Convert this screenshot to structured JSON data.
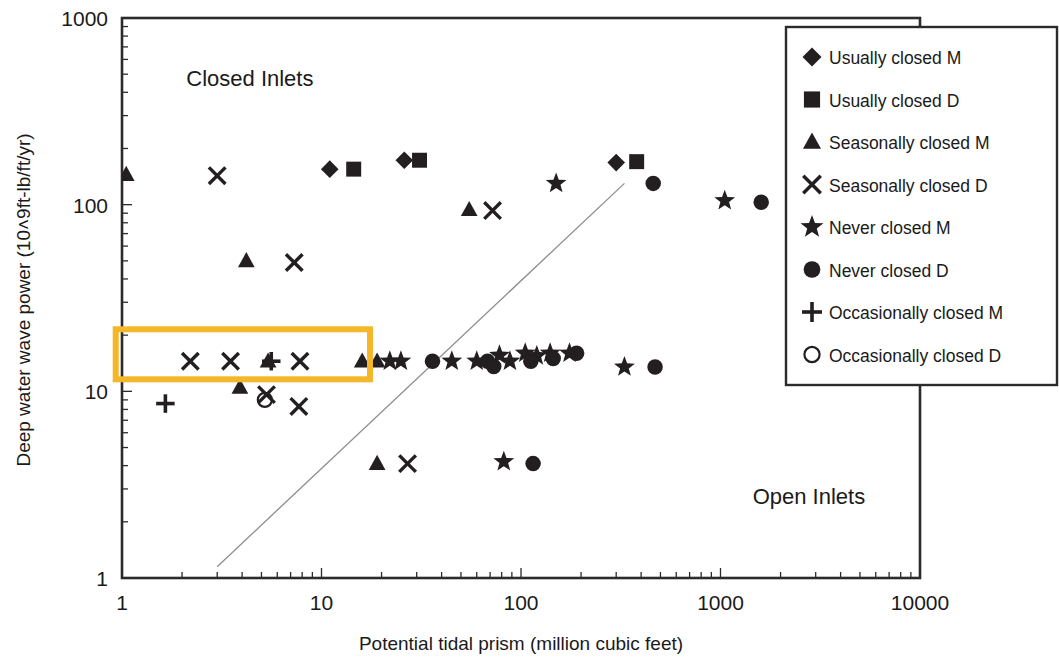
{
  "chart_data": {
    "type": "scatter",
    "title": "",
    "xlabel": "Potential tidal prism (million cubic feet)",
    "ylabel": "Deep water wave power (10^9ft-lb/ft/yr)",
    "ylabel_display": "Deep water wave power (10˄9ft-lb/ft/yr)",
    "xscale": "log",
    "yscale": "log",
    "xlim": [
      1,
      10000
    ],
    "ylim": [
      1,
      1000
    ],
    "xticks": [
      1,
      10,
      100,
      1000,
      10000
    ],
    "xtick_labels": [
      "1",
      "10",
      "100",
      "1000",
      "10000"
    ],
    "yticks": [
      1,
      10,
      100,
      1000
    ],
    "ytick_labels": [
      "1",
      "10",
      "100",
      "1000"
    ],
    "grid": false,
    "legend_position": "top-right",
    "annotations": [
      {
        "text": "Closed Inlets",
        "x": 2.1,
        "y": 430
      },
      {
        "text": "Open Inlets",
        "x": 1450,
        "y": 2.5
      }
    ],
    "trend_line": {
      "x": [
        3.0,
        330
      ],
      "y": [
        1.15,
        130
      ],
      "style": "thin-gray-solid"
    },
    "series": [
      {
        "name": "Usually closed M",
        "marker": "diamond",
        "points": [
          [
            11.0,
            155
          ],
          [
            26.0,
            173
          ],
          [
            300.0,
            168
          ]
        ]
      },
      {
        "name": "Usually closed D",
        "marker": "square",
        "points": [
          [
            14.5,
            155
          ],
          [
            31.0,
            173
          ],
          [
            380.0,
            170
          ]
        ]
      },
      {
        "name": "Seasonally closed M",
        "marker": "triangle",
        "points": [
          [
            1.05,
            145
          ],
          [
            4.2,
            50
          ],
          [
            55.0,
            94
          ],
          [
            3.9,
            10.5
          ],
          [
            5.4,
            14.5
          ],
          [
            16.0,
            14.5
          ],
          [
            19.0,
            14.5
          ],
          [
            19.0,
            4.1
          ]
        ]
      },
      {
        "name": "Seasonally closed D",
        "marker": "x",
        "points": [
          [
            3.0,
            143
          ],
          [
            7.3,
            49
          ],
          [
            72.0,
            93
          ],
          [
            2.2,
            14.5
          ],
          [
            3.5,
            14.5
          ],
          [
            7.8,
            14.5
          ],
          [
            5.3,
            9.6
          ],
          [
            7.7,
            8.3
          ],
          [
            27.0,
            4.1
          ]
        ]
      },
      {
        "name": "Never closed M",
        "marker": "star",
        "points": [
          [
            150.0,
            130
          ],
          [
            22.0,
            14.5
          ],
          [
            25.0,
            14.5
          ],
          [
            45.0,
            14.5
          ],
          [
            60.0,
            14.5
          ],
          [
            78.0,
            15.6
          ],
          [
            88.0,
            14.5
          ],
          [
            105.0,
            16.0
          ],
          [
            120.0,
            15.5
          ],
          [
            140.0,
            16.0
          ],
          [
            175.0,
            16.0
          ],
          [
            330.0,
            13.5
          ],
          [
            1050.0,
            105
          ],
          [
            82.0,
            4.2
          ]
        ]
      },
      {
        "name": "Never closed D",
        "marker": "circle",
        "points": [
          [
            460.0,
            130
          ],
          [
            36.0,
            14.5
          ],
          [
            68.0,
            14.5
          ],
          [
            73.0,
            13.6
          ],
          [
            112.0,
            14.5
          ],
          [
            145.0,
            15.0
          ],
          [
            190.0,
            16.0
          ],
          [
            470.0,
            13.5
          ],
          [
            1600.0,
            103
          ],
          [
            115.0,
            4.1
          ]
        ]
      },
      {
        "name": "Occasionally closed M",
        "marker": "plus",
        "points": [
          [
            1.65,
            8.6
          ],
          [
            5.6,
            14.5
          ]
        ]
      },
      {
        "name": "Occasionally closed D",
        "marker": "circle-open",
        "points": [
          [
            5.2,
            9.0
          ]
        ]
      }
    ],
    "highlight": {
      "color": "#F5B72A",
      "x_range": [
        0.93,
        17.5
      ],
      "y_range": [
        11.6,
        21.5
      ]
    }
  },
  "legend": {
    "entries": [
      {
        "marker": "diamond",
        "label": "Usually closed  M"
      },
      {
        "marker": "square",
        "label": "Usually closed  D"
      },
      {
        "marker": "triangle",
        "label": "Seasonally  closed  M"
      },
      {
        "marker": "x",
        "label": "Seasonally  closed  D"
      },
      {
        "marker": "star",
        "label": "Never  closed  M"
      },
      {
        "marker": "circle",
        "label": "Never  closed  D"
      },
      {
        "marker": "plus",
        "label": "Occasionally  closed  M"
      },
      {
        "marker": "circle-open",
        "label": "Occasionally  closed  D"
      }
    ]
  },
  "colors": {
    "marker": "#231f20",
    "frame": "#2b2b2b",
    "trend": "#8d8d8d",
    "highlight": "#F5B72A",
    "background": "#ffffff"
  }
}
